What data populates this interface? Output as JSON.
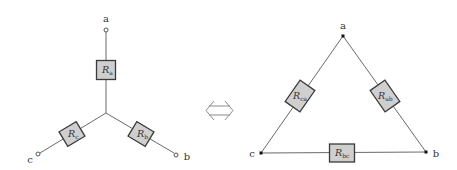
{
  "wye": {
    "nodes": {
      "a": "a",
      "b": "b",
      "c": "c"
    },
    "resistors": {
      "a": {
        "symbol": "R",
        "subscript": "a"
      },
      "b": {
        "symbol": "R",
        "subscript": "b"
      },
      "c": {
        "symbol": "R",
        "subscript": "c"
      }
    }
  },
  "equivalence_symbol": "⟺",
  "delta": {
    "nodes": {
      "a": "a",
      "b": "b",
      "c": "c"
    },
    "resistors": {
      "ab": {
        "symbol": "R",
        "subscript": "ab"
      },
      "bc": {
        "symbol": "R",
        "subscript": "bc"
      },
      "ca": {
        "symbol": "R",
        "subscript": "ca"
      }
    }
  },
  "colors": {
    "wire": "#6a6a6a",
    "resistor_fill": "#cfcfcf",
    "resistor_stroke": "#3a3a3a",
    "background": "#ffffff"
  }
}
